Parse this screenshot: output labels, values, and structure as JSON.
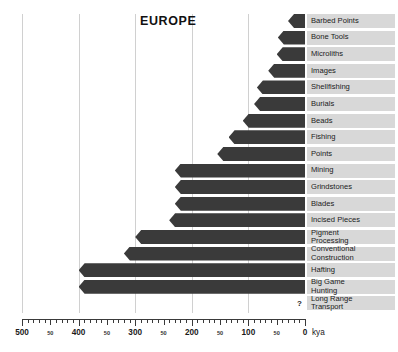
{
  "chart_data": {
    "type": "bar",
    "orientation": "horizontal",
    "title": "EUROPE",
    "xlabel": "kya",
    "ylabel": "",
    "xlim": [
      500,
      0
    ],
    "x_axis_reversed": true,
    "grid": true,
    "legend": false,
    "major_ticks": [
      500,
      400,
      300,
      200,
      100,
      0
    ],
    "minor_tick_labels": [
      "50",
      "50",
      "50",
      "50",
      "50"
    ],
    "minor_tick_values": [
      450,
      350,
      250,
      150,
      50
    ],
    "minor_tick_interval": 10,
    "bar_color": "#3a3a3a",
    "label_band_color": "#d8d8d8",
    "gridline_color": "#d0d0d0",
    "annotation": "?",
    "annotation_note": "Long Range Transport has no bar; a question mark is shown near 0 kya",
    "categories": [
      "Barbed Points",
      "Bone Tools",
      "Microliths",
      "Images",
      "Shellfishing",
      "Burials",
      "Beads",
      "Fishing",
      "Points",
      "Mining",
      "Grindstones",
      "Blades",
      "Incised Pieces",
      "Pigment\nProcessing",
      "Conventional\nConstruction",
      "Hafting",
      "Big Game\nHunting",
      "Long Range\nTransport"
    ],
    "values": [
      30,
      48,
      50,
      65,
      85,
      90,
      110,
      135,
      155,
      230,
      230,
      230,
      240,
      300,
      320,
      400,
      400,
      null
    ],
    "value_unit": "kya (earliest appearance)",
    "bars": [
      {
        "label": "Barbed Points",
        "start_kya": 30,
        "end_kya": 0
      },
      {
        "label": "Bone Tools",
        "start_kya": 48,
        "end_kya": 0
      },
      {
        "label": "Microliths",
        "start_kya": 50,
        "end_kya": 0
      },
      {
        "label": "Images",
        "start_kya": 65,
        "end_kya": 0
      },
      {
        "label": "Shellfishing",
        "start_kya": 85,
        "end_kya": 0
      },
      {
        "label": "Burials",
        "start_kya": 90,
        "end_kya": 0
      },
      {
        "label": "Beads",
        "start_kya": 110,
        "end_kya": 0
      },
      {
        "label": "Fishing",
        "start_kya": 135,
        "end_kya": 0
      },
      {
        "label": "Points",
        "start_kya": 155,
        "end_kya": 0
      },
      {
        "label": "Mining",
        "start_kya": 230,
        "end_kya": 0
      },
      {
        "label": "Grindstones",
        "start_kya": 230,
        "end_kya": 0
      },
      {
        "label": "Blades",
        "start_kya": 230,
        "end_kya": 0
      },
      {
        "label": "Incised Pieces",
        "start_kya": 240,
        "end_kya": 0
      },
      {
        "label": "Pigment\nProcessing",
        "start_kya": 300,
        "end_kya": 0
      },
      {
        "label": "Conventional\nConstruction",
        "start_kya": 320,
        "end_kya": 0
      },
      {
        "label": "Hafting",
        "start_kya": 400,
        "end_kya": 0
      },
      {
        "label": "Big Game\nHunting",
        "start_kya": 400,
        "end_kya": 0
      },
      {
        "label": "Long Range\nTransport",
        "start_kya": null,
        "end_kya": null
      }
    ]
  }
}
